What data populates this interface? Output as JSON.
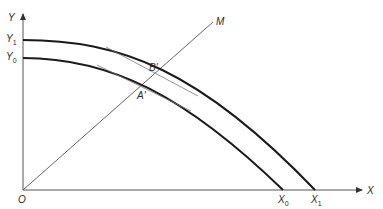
{
  "diagram": {
    "axes": {
      "y_label": "Y",
      "x_label": "X",
      "origin_label": "O"
    },
    "ray": {
      "label": "M"
    },
    "curves": [
      {
        "name": "outer-ppf",
        "y_intercept_label": "Y",
        "y_intercept_sub": "1",
        "x_intercept_label": "X",
        "x_intercept_sub": "1",
        "point_label": "B'"
      },
      {
        "name": "inner-ppf",
        "y_intercept_label": "Y",
        "y_intercept_sub": "0",
        "x_intercept_label": "X",
        "x_intercept_sub": "0",
        "point_label": "A'"
      }
    ],
    "colors": {
      "curve": "#1a1a1a",
      "axis": "#555555",
      "tangent": "#777777",
      "background": "#ffffff"
    }
  }
}
